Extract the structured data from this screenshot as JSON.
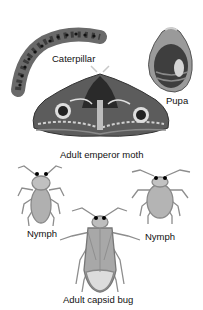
{
  "figure": {
    "labels": {
      "caterpillar": "Caterpillar",
      "pupa": "Pupa",
      "adult_moth": "Adult emperor moth",
      "nymph_left": "Nymph",
      "nymph_right": "Nymph",
      "adult_bug": "Adult capsid bug"
    },
    "groups": [
      {
        "title": "Complete metamorphosis",
        "stages": [
          "Caterpillar",
          "Pupa",
          "Adult emperor moth"
        ]
      },
      {
        "title": "Incomplete metamorphosis",
        "stages": [
          "Nymph",
          "Nymph",
          "Adult capsid bug"
        ]
      }
    ],
    "colors": {
      "background": "#ffffff",
      "ink": "#111111",
      "dark_gray": "#3a3a3a",
      "mid_gray": "#7a7a7a",
      "light_gray": "#b5b5b5"
    }
  }
}
